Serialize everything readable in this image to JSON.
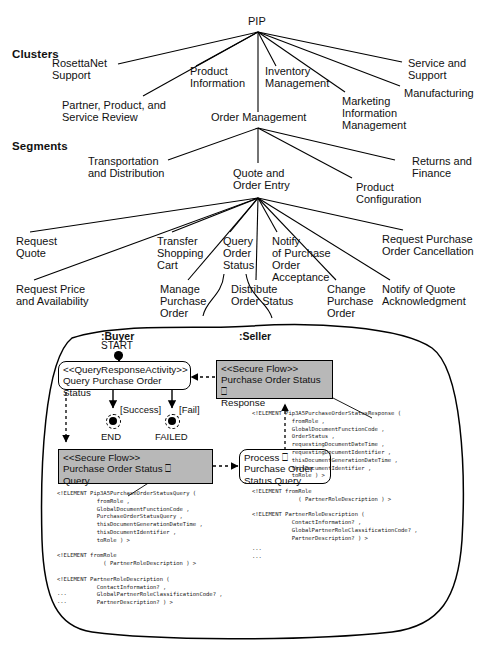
{
  "figure": {
    "root": "PIP",
    "sections": [
      {
        "label": "Clusters"
      },
      {
        "label": "Segments"
      }
    ]
  },
  "clusters": [
    {
      "label": "RosettaNet\nSupport"
    },
    {
      "label": "Partner, Product, and\nService Review"
    },
    {
      "label": "Product\nInformation"
    },
    {
      "label": "Inventory\nManagement"
    },
    {
      "label": "Order Management"
    },
    {
      "label": "Marketing\nInformation\nManagement"
    },
    {
      "label": "Service and\nSupport"
    },
    {
      "label": "Manufacturing"
    }
  ],
  "segments": [
    {
      "label": "Transportation\nand Distribution"
    },
    {
      "label": "Quote and\nOrder Entry"
    },
    {
      "label": "Product\nConfiguration"
    },
    {
      "label": "Returns and\nFinance"
    }
  ],
  "pips": [
    {
      "label": "Request\nQuote"
    },
    {
      "label": "Request Price\nand Availability"
    },
    {
      "label": "Transfer\nShopping\nCart"
    },
    {
      "label": "Manage\nPurchase\nOrder"
    },
    {
      "label": "Query\nOrder\nStatus"
    },
    {
      "label": "Distribute\nOrder Status"
    },
    {
      "label": "Notify\nof Purchase\nOrder\nAcceptance"
    },
    {
      "label": "Change\nPurchase\nOrder"
    },
    {
      "label": "Notify of Quote\nAcknowledgment"
    },
    {
      "label": "Request Purchase\nOrder Cancellation"
    }
  ],
  "activity": {
    "roles": {
      "buyer": ":Buyer",
      "seller": ":Seller"
    },
    "start_label": "START",
    "end_label": "END",
    "failed_label": "FAILED",
    "guard_success": "[Success]",
    "guard_fail": "[Fail]",
    "boxes": {
      "query_activity": "<<QueryResponseActivity>>\nQuery Purchase Order Status",
      "secure_flow_response": "<<Secure Flow>>\nPurchase Order Status ⎕\nResponse",
      "secure_flow_query": "<<Secure Flow>>\nPurchase Order Status ⎕\nQuery",
      "process_query": "Process ⎕\nPurchase Order\nStatus Query"
    }
  },
  "code": {
    "left": "<!ELEMENT Pip3A5PurchaseOrderStatusQuery (\n            fromRole ,\n            GlobalDocumentFunctionCode ,\n            PurchaseOrderStatusQuery ,\n            thisDocumentGenerationDateTime ,\n            thisDocumentIdentifier ,\n            toRole ) >\n\n<!ELEMENT fromRole\n              ( PartnerRoleDescription ) >\n\n<!ELEMENT PartnerRoleDescription (\n            ContactInformation? ,\n            GlobalPartnerRoleClassificationCode? ,\n            PartnerDescription? ) >",
    "left_ellipsis": "...\n...",
    "right": "<!ELEMENT Pip3A5PurchaseOrderStatusResponse (\n            fromRole ,\n            GlobalDocumentFunctionCode ,\n            OrderStatus ,\n            requestingDocumentDateTime ,\n            requestingDocumentIdentifier ,\n            thisDocumentGenerationDateTime ,\n            thisDocumentIdentifier ,\n            toRole ) >\n\n<!ELEMENT fromRole\n              ( PartnerRoleDescription ) >\n\n<!ELEMENT PartnerRoleDescription (\n            ContactInformation? ,\n            GlobalPartnerRoleClassificationCode? ,\n            PartnerDescription? ) >",
    "right_ellipsis": "...\n..."
  },
  "colors": {
    "secure_flow_fill": "#b8b8b8",
    "line": "#000000",
    "text": "#111111"
  }
}
